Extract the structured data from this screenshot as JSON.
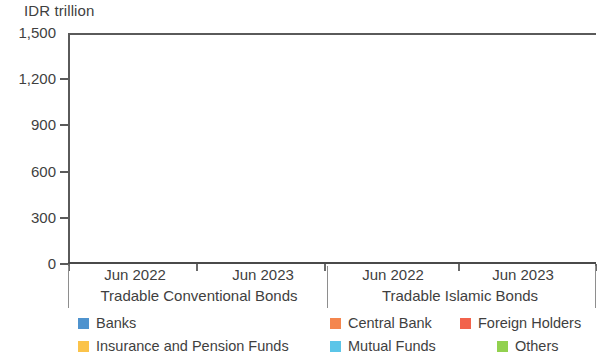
{
  "chart_data": {
    "type": "bar",
    "title": "",
    "ylabel": "IDR trillion",
    "xlabel": "",
    "ylim": [
      0,
      1500
    ],
    "yticks": [
      "0",
      "300",
      "600",
      "900",
      "1,200",
      "1,500"
    ],
    "ytick_values": [
      0,
      300,
      600,
      900,
      1200,
      1500
    ],
    "grid": false,
    "legend_position": "bottom",
    "sections": [
      {
        "name": "Tradable Conventional Bonds",
        "periods": [
          "Jun 2022",
          "Jun 2023"
        ]
      },
      {
        "name": "Tradable Islamic Bonds",
        "periods": [
          "Jun 2022",
          "Jun 2023"
        ]
      }
    ],
    "categories": [
      "Jun 2022",
      "Jun 2023",
      "Jun 2022",
      "Jun 2023"
    ],
    "series": [
      {
        "name": "Banks",
        "color": "#4F93CE",
        "values": [
          1085,
          1360,
          340,
          330
        ]
      },
      {
        "name": "Central Bank",
        "color": "#F4864E",
        "values": [
          910,
          815,
          110,
          130
        ]
      },
      {
        "name": "Foreign Holders",
        "color": "#F2634C",
        "values": [
          760,
          820,
          30,
          25
        ]
      },
      {
        "name": "Insurance and Pension Funds",
        "color": "#FBC34A",
        "values": [
          575,
          700,
          195,
          240
        ]
      },
      {
        "name": "Mutual Funds",
        "color": "#5BC5E8",
        "values": [
          140,
          155,
          35,
          40
        ]
      },
      {
        "name": "Others",
        "color": "#92D14F",
        "values": [
          495,
          560,
          200,
          270
        ]
      }
    ]
  },
  "legend": {
    "items": [
      {
        "label": "Banks",
        "color": "#4F93CE"
      },
      {
        "label": "Central Bank",
        "color": "#F4864E"
      },
      {
        "label": "Foreign Holders",
        "color": "#F2634C"
      },
      {
        "label": "Insurance and Pension Funds",
        "color": "#FBC34A"
      },
      {
        "label": "Mutual Funds",
        "color": "#5BC5E8"
      },
      {
        "label": "Others",
        "color": "#92D14F"
      }
    ]
  }
}
